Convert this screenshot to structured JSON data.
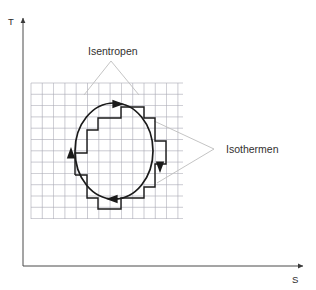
{
  "figure": {
    "kind": "thermodynamic-cycle-diagram",
    "background_color": "#ffffff"
  },
  "axes": {
    "y": {
      "label": "T",
      "name": "temperature-axis",
      "color": "#4a4a4a",
      "x": 23,
      "top_y": 18,
      "bottom_y": 266
    },
    "x": {
      "label": "S",
      "name": "entropy-axis",
      "color": "#4a4a4a",
      "y": 266,
      "left_x": 23,
      "right_x": 303
    }
  },
  "grid": {
    "color": "#a9a9b4",
    "left": 31,
    "top": 83,
    "right": 183,
    "bottom": 219,
    "cell": 11.3,
    "cols": 14,
    "rows": 12
  },
  "callouts": [
    {
      "label": "Isentropen",
      "name": "callout-isentropen",
      "text_x": 88,
      "text_y": 55,
      "apex_x": 111,
      "apex_y": 61,
      "leader_color": "#bdbdbd",
      "targets": [
        {
          "x": 84,
          "y": 95
        },
        {
          "x": 139,
          "y": 95
        }
      ]
    },
    {
      "label": "Isothermen",
      "name": "callout-isothermen",
      "text_x": 226,
      "text_y": 153,
      "apex_x": 214,
      "apex_y": 149,
      "leader_color": "#bdbdbd",
      "targets": [
        {
          "x": 154,
          "y": 121
        },
        {
          "x": 157,
          "y": 183
        }
      ]
    }
  ],
  "cycle": {
    "name": "carnot-cycle-path",
    "stroke_color": "#1a1a1a",
    "ellipse": {
      "cx": 114,
      "cy": 151,
      "rx": 39,
      "ry": 48
    },
    "staircase_points": "75,175 75,153 87,153 87,130 98,130 98,118 121,118 121,107 144,107 144,118 155,118 155,141 166,141 166,164 155,164 155,187 144,187 144,198 121,198 121,209 98,209 98,198 87,198 87,175 75,175",
    "arrows": [
      {
        "name": "arrow-top",
        "x": 118,
        "y": 104,
        "angle": 0
      },
      {
        "name": "arrow-right",
        "x": 160,
        "y": 167,
        "angle": 90
      },
      {
        "name": "arrow-bottom",
        "x": 112,
        "y": 199,
        "angle": 180
      },
      {
        "name": "arrow-left",
        "x": 71,
        "y": 153,
        "angle": 270
      }
    ]
  }
}
